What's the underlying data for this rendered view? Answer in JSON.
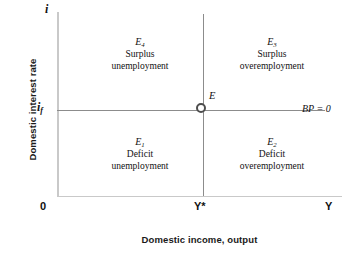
{
  "figure": {
    "axes": {
      "y_axis_title": "Domestic interest rate",
      "x_axis_title": "Domestic income, output",
      "y_axis_top_symbol": "i",
      "origin_label": "0",
      "x_axis_end_symbol": "Y"
    },
    "ticks": {
      "interest_rate_foreign": "i",
      "interest_rate_foreign_sub": "f",
      "output_potential": "Y",
      "output_potential_star": "*"
    },
    "schedule": {
      "bp_label": "BP = 0"
    },
    "equilibrium": {
      "label": "E",
      "marker": "open-circle"
    },
    "quadrants": [
      {
        "id": "top-left",
        "symbol": "E",
        "subscript": "4",
        "line1": "Surplus",
        "line2": "unemployment"
      },
      {
        "id": "top-right",
        "symbol": "E",
        "subscript": "3",
        "line1": "Surplus",
        "line2": "overemployment"
      },
      {
        "id": "bottom-left",
        "symbol": "E",
        "subscript": "1",
        "line1": "Deficit",
        "line2": "unemployment"
      },
      {
        "id": "bottom-right",
        "symbol": "E",
        "subscript": "2",
        "line1": "Deficit",
        "line2": "overemployment"
      }
    ]
  },
  "chart_data": {
    "type": "diagram",
    "title": "",
    "xlabel": "Domestic income, output",
    "ylabel": "Domestic interest rate",
    "grid": false,
    "legend": "none",
    "axis_symbols": {
      "x": "Y",
      "y": "i",
      "origin": "0"
    },
    "reference_lines": [
      {
        "name": "BP = 0",
        "orientation": "horizontal",
        "value_symbol": "i_f",
        "label": "BP = 0",
        "meaning": "external balance: balance of payments equals zero"
      },
      {
        "name": "Y*",
        "orientation": "vertical",
        "value_symbol": "Y*",
        "label": "Y*",
        "meaning": "internal balance: full-employment level of output"
      }
    ],
    "points": [
      {
        "label": "E",
        "x_symbol": "Y*",
        "y_symbol": "i_f",
        "marker": "open-circle",
        "meaning": "simultaneous internal and external balance"
      }
    ],
    "regions": [
      {
        "label": "E4",
        "quadrant": "top-left",
        "x_condition": "Y < Y*",
        "y_condition": "i > i_f",
        "external": "Surplus",
        "internal": "unemployment"
      },
      {
        "label": "E3",
        "quadrant": "top-right",
        "x_condition": "Y > Y*",
        "y_condition": "i > i_f",
        "external": "Surplus",
        "internal": "overemployment"
      },
      {
        "label": "E1",
        "quadrant": "bottom-left",
        "x_condition": "Y < Y*",
        "y_condition": "i < i_f",
        "external": "Deficit",
        "internal": "unemployment"
      },
      {
        "label": "E2",
        "quadrant": "bottom-right",
        "x_condition": "Y > Y*",
        "y_condition": "i < i_f",
        "external": "Deficit",
        "internal": "overemployment"
      }
    ],
    "colors": {
      "background": "#ffffff",
      "axis": "#c9c9c9",
      "schedule_line": "#8c8c8c",
      "text": "#111111",
      "marker_ring": "#4d4d4d"
    }
  }
}
